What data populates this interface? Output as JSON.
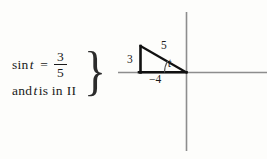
{
  "figure": {
    "type": "trigonometry-reference-triangle",
    "given": {
      "function_name": "sin",
      "variable": "t",
      "equals_sign": "=",
      "fraction_numerator": "3",
      "fraction_denominator": "5",
      "condition_prefix": "and",
      "condition_variable": "t",
      "condition_text": "is in",
      "quadrant": "II",
      "brace": "}"
    },
    "diagram": {
      "labels": {
        "opposite_leg": "3",
        "hypotenuse": "5",
        "adjacent_leg": "−4",
        "angle": "t"
      },
      "triangle_vertices": {
        "top_left": [
          22,
          40
        ],
        "bottom_left": [
          22,
          66
        ],
        "origin": [
          68,
          66
        ]
      },
      "axes": {
        "origin_x": 68,
        "origin_y": 66,
        "x_axis_from": 0,
        "x_axis_to": 149,
        "y_axis_from": 6,
        "y_axis_to": 145
      },
      "colors": {
        "axis": "#8d8d8d",
        "triangle_stroke": "#111111",
        "text": "#1a1a1a",
        "arc": "#555555",
        "background": "#fdfdfb"
      }
    }
  }
}
